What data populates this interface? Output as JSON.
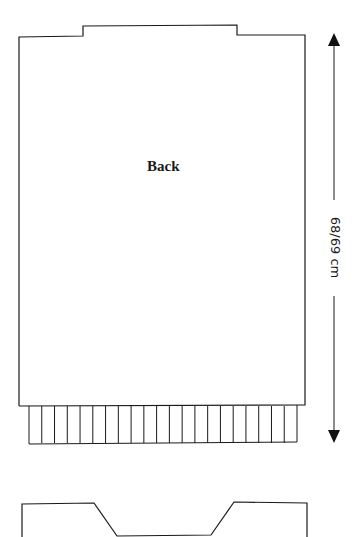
{
  "diagram": {
    "type": "knitting-schematic",
    "pieces": [
      {
        "name": "back",
        "label": "Back",
        "has_ribbing": true,
        "ribbing_columns": 21
      },
      {
        "name": "front",
        "label": "",
        "partial": true
      }
    ],
    "dimensions": [
      {
        "name": "length",
        "label": "68/69 cm",
        "orientation": "vertical",
        "arrow_heads": [
          "up",
          "down"
        ]
      }
    ],
    "colors": {
      "line": "#1a1a1a",
      "background": "#ffffff"
    }
  }
}
